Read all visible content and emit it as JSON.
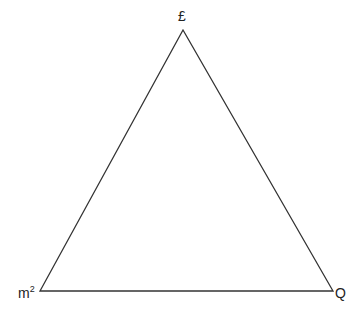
{
  "diagram": {
    "type": "triangle",
    "stroke_color": "#333333",
    "background": "#ffffff",
    "vertices": [
      {
        "id": "top",
        "label": "£",
        "x": 183,
        "y": 30
      },
      {
        "id": "bottom-left",
        "label_base": "m",
        "label_sup": "2",
        "x": 40,
        "y": 291
      },
      {
        "id": "bottom-right",
        "label": "Q",
        "x": 333,
        "y": 291
      }
    ]
  }
}
